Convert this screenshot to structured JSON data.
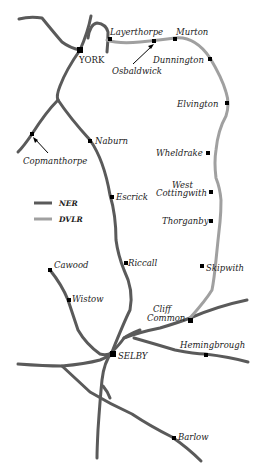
{
  "map": {
    "legend": {
      "items": [
        {
          "label": "NER",
          "color": "#5a5a5a"
        },
        {
          "label": "DVLR",
          "color": "#a0a0a0"
        }
      ]
    },
    "stations": {
      "york": "YORK",
      "layerthorpe": "Layerthorpe",
      "murton": "Murton",
      "osbaldwick": "Osbaldwick",
      "dunnington": "Dunnington",
      "elvington": "Elvington",
      "wheldrake": "Wheldrake",
      "west_cottingwith_1": "West",
      "west_cottingwith_2": "Cottingwith",
      "thorganby": "Thorganby",
      "skipwith": "Skipwith",
      "cliff_common_1": "Cliff",
      "cliff_common_2": "Common",
      "naburn": "Naburn",
      "copmanthorpe": "Copmanthorpe",
      "escrick": "Escrick",
      "riccall": "Riccall",
      "cawood": "Cawood",
      "wistow": "Wistow",
      "selby": "SELBY",
      "hemingbrough": "Hemingbrough",
      "barlow": "Barlow"
    }
  }
}
